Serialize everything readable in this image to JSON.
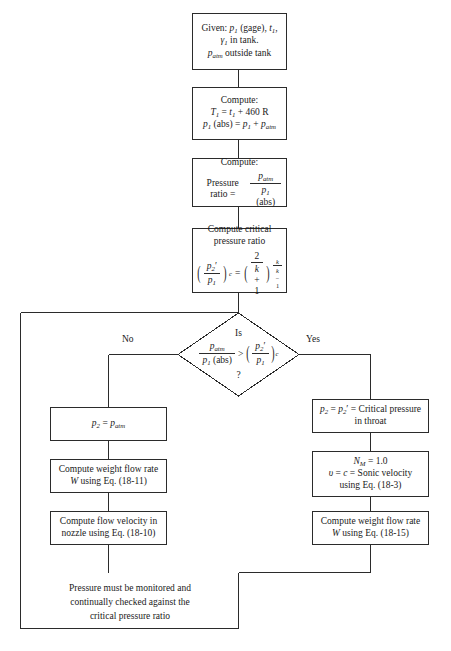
{
  "nodes": {
    "given": {
      "name": "given-box",
      "line1_prefix": "Given: ",
      "line1": "p1 (gage), t1,",
      "line2": "γ1 in tank.",
      "line3": "patm outside tank"
    },
    "compute_temp": {
      "name": "compute-absolute-box",
      "line1": "Compute:",
      "line2": "T1 = t1 + 460 R",
      "line3": "p1 (abs) = p1 + patm"
    },
    "pressure_ratio": {
      "name": "pressure-ratio-box",
      "line1": "Compute:",
      "line2_label": "Pressure ratio =",
      "numerator": "patm",
      "denominator": "p1 (abs)"
    },
    "critical_ratio": {
      "name": "critical-pressure-ratio-box",
      "line1": "Compute critical",
      "line2": "pressure ratio",
      "equation": "(p2'/p1)c = (2/(k+1))^(k/(k-1))",
      "lhs_num": "p2'",
      "lhs_den": "p1",
      "lhs_sub": "c",
      "operator": "=",
      "rhs_num": "2",
      "rhs_den": "k + 1",
      "exp_num": "k",
      "exp_den": "k − 1"
    },
    "decision": {
      "name": "decision-diamond",
      "line_is": "Is",
      "lhs_num": "patm",
      "lhs_den": "p1 (abs)",
      "operator": ">",
      "rhs_num": "p2'",
      "rhs_den": "p1",
      "rhs_sub": "c",
      "question_mark": "?",
      "label_no": "No",
      "label_yes": "Yes"
    },
    "left_p2": {
      "name": "p2-equals-patm-box",
      "text": "p2 = patm"
    },
    "left_flow": {
      "name": "weight-flow-rate-18-11-box",
      "line1": "Compute weight flow rate",
      "line2": "W using Eq. (18-11)"
    },
    "left_velocity": {
      "name": "flow-velocity-18-10-box",
      "line1": "Compute flow velocity in",
      "line2": "nozzle using Eq. (18-10)"
    },
    "right_p2": {
      "name": "critical-pressure-throat-box",
      "line1": "p2 = p2' = Critical pressure",
      "line2": "in throat"
    },
    "right_sonic": {
      "name": "sonic-velocity-18-3-box",
      "line1": "NM = 1.0",
      "line2": "υ = c = Sonic velocity",
      "line3": "using Eq. (18-3)"
    },
    "right_flow": {
      "name": "weight-flow-rate-18-15-box",
      "line1": "Compute weight flow rate",
      "line2": "W using Eq. (18-15)"
    },
    "footer": {
      "name": "monitoring-note",
      "line1": "Pressure must be monitored and",
      "line2": "continually checked against the",
      "line3": "critical pressure ratio"
    }
  },
  "colors": {
    "stroke": "#2b2b2b",
    "text": "#1a1a1a",
    "background": "#ffffff"
  }
}
